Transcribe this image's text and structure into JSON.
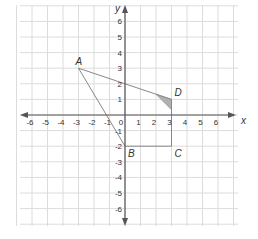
{
  "diagram": {
    "type": "coordinate-plane",
    "axes": {
      "x_label": "x",
      "y_label": "y",
      "x_ticks": [
        "-6",
        "-5",
        "-4",
        "-3",
        "-2",
        "-1",
        "0",
        "1",
        "2",
        "3",
        "4",
        "5",
        "6"
      ],
      "y_ticks": [
        "6",
        "5",
        "4",
        "3",
        "2",
        "1",
        "-1",
        "-2",
        "-3",
        "-4",
        "-5",
        "-6"
      ],
      "range": [
        -6,
        6
      ]
    },
    "points": [
      {
        "name": "A",
        "x": -3,
        "y": 3
      },
      {
        "name": "B",
        "x": 0,
        "y": -2
      },
      {
        "name": "C",
        "x": 3,
        "y": -2
      },
      {
        "name": "D",
        "x": 3,
        "y": 1
      }
    ],
    "segments": [
      {
        "from": "A",
        "to": "D"
      },
      {
        "from": "A",
        "to": "B"
      },
      {
        "from": "B",
        "to": "C"
      },
      {
        "from": "C",
        "to": "D"
      }
    ],
    "shaded_region": {
      "description": "small shaded triangle near D",
      "vertices": [
        [
          2,
          1.33
        ],
        [
          3,
          1
        ],
        [
          3,
          0.33
        ]
      ],
      "color": "#b0b0b0"
    },
    "colors": {
      "grid": "#dcdcdc",
      "axis": "#555555",
      "segment": "#888888",
      "shade": "#b0b0b0"
    }
  }
}
